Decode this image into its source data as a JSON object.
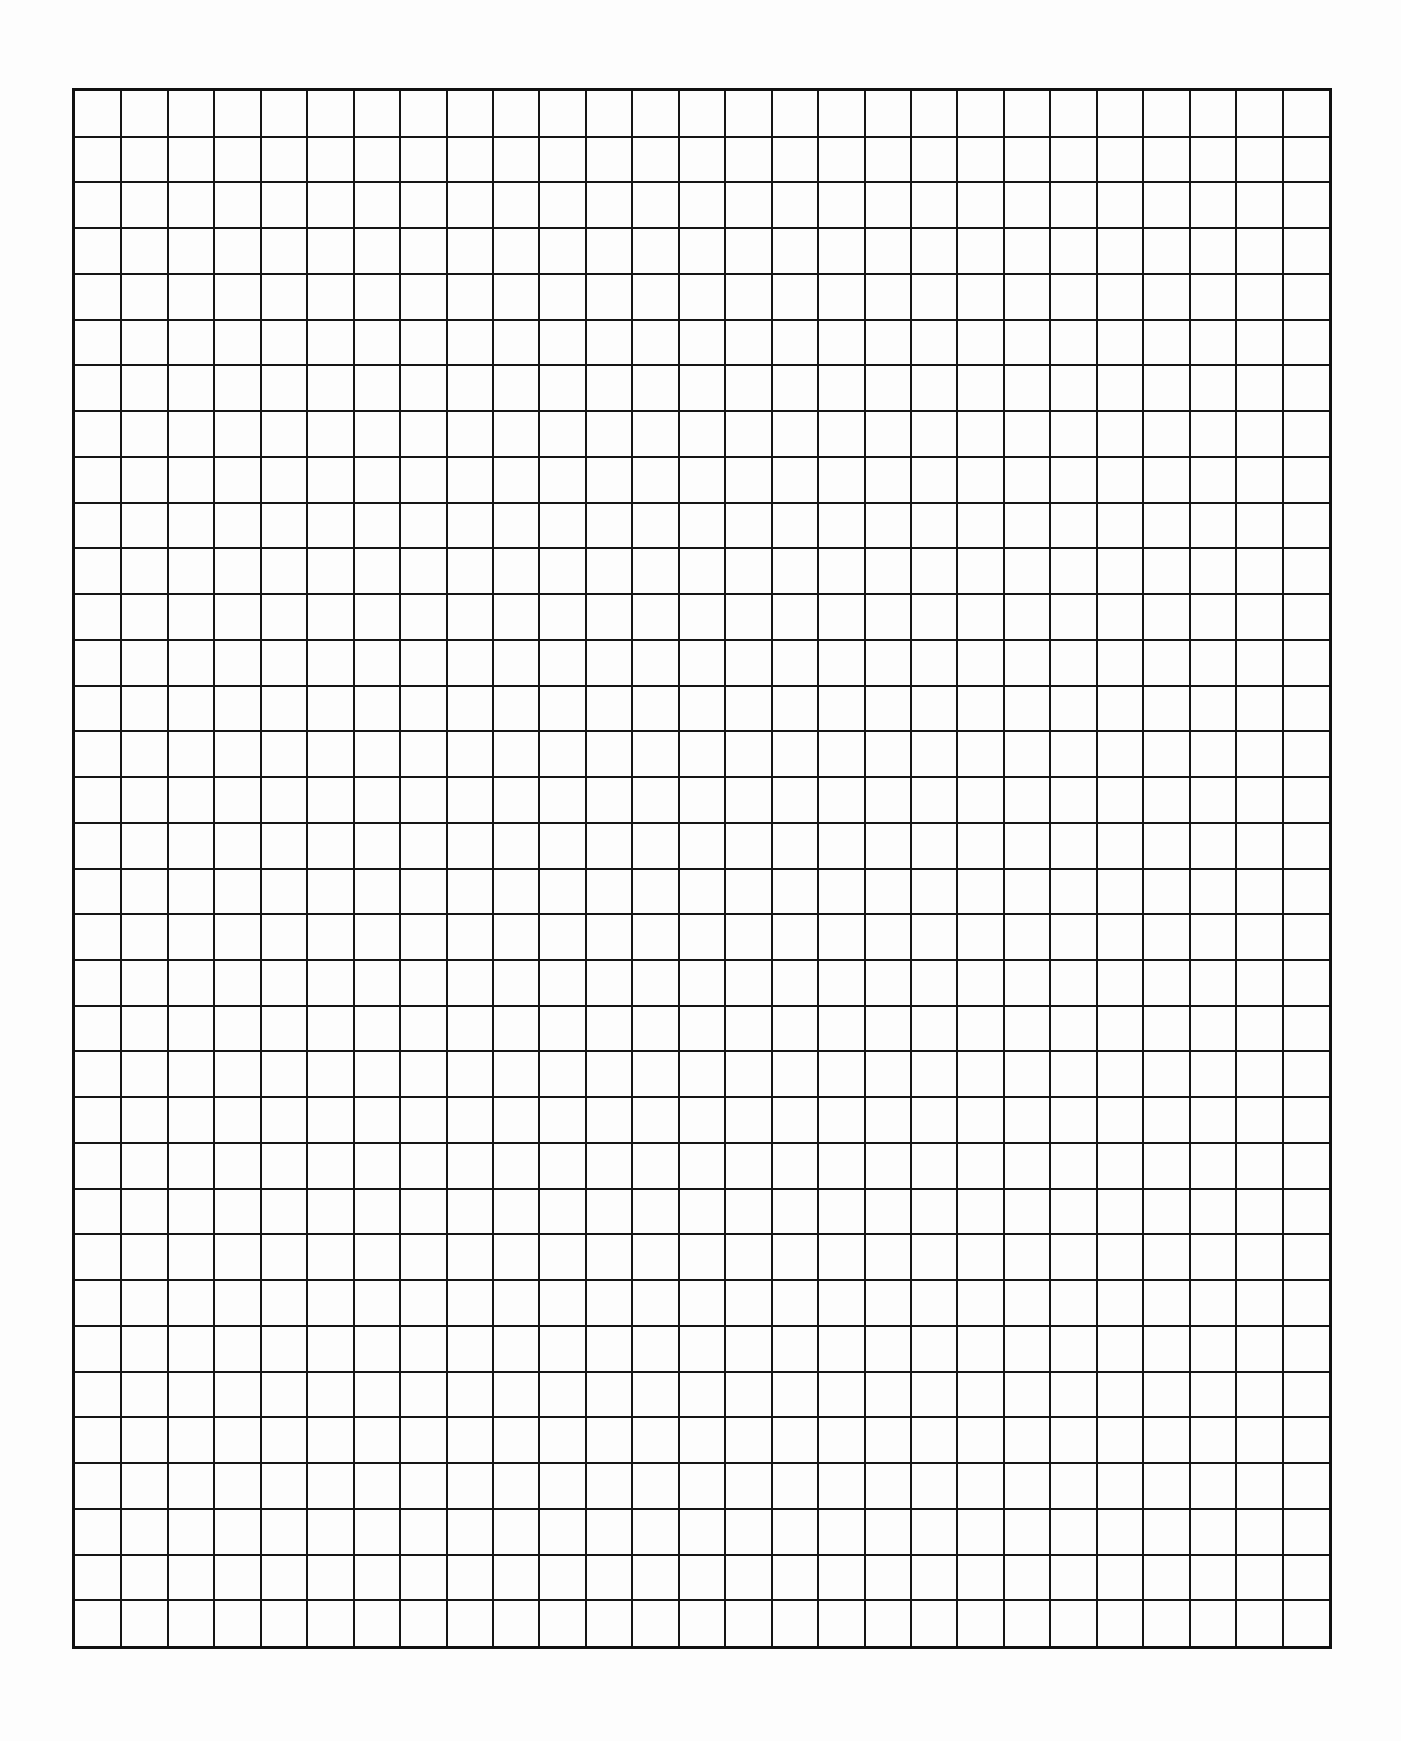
{
  "document": {
    "type": "graph-paper",
    "title": "",
    "grid": {
      "columns": 27,
      "rows": 34,
      "left": 72,
      "top": 88,
      "width": 1260,
      "height": 1561,
      "line_color": "#151515",
      "paper_color": "#fdfdfd"
    }
  }
}
